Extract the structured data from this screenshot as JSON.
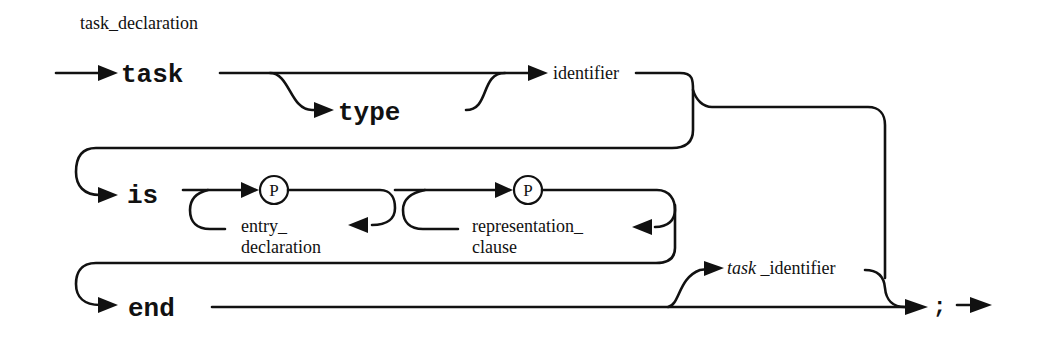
{
  "diagram": {
    "title": "task_declaration",
    "type": "railroad syntax diagram",
    "colors": {
      "ink": "#111111",
      "background": "#ffffff"
    },
    "keywords": {
      "task": "task",
      "type": "type",
      "is": "is",
      "end": "end",
      "semicolon": ";"
    },
    "nonterminals": {
      "identifier": "identifier",
      "entry_line1": "entry_",
      "entry_line2": "declaration",
      "rep_line1": "representation_",
      "rep_line2": "clause",
      "task_identifier_italic": "task",
      "task_identifier_rest": " _identifier"
    },
    "pragma_marks": {
      "p1": "P",
      "p2": "P"
    }
  }
}
